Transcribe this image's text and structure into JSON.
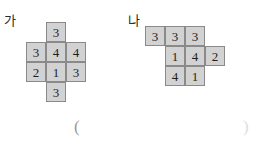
{
  "figures": [
    {
      "label": "가",
      "label_x": 4,
      "label_y": 14,
      "grid_x": 26,
      "grid_y": 22,
      "cells": [
        {
          "col": 1,
          "row": 0,
          "value": "3"
        },
        {
          "col": 0,
          "row": 1,
          "value": "3"
        },
        {
          "col": 1,
          "row": 1,
          "value": "4"
        },
        {
          "col": 2,
          "row": 1,
          "value": "4"
        },
        {
          "col": 0,
          "row": 2,
          "value": "2"
        },
        {
          "col": 1,
          "row": 2,
          "value": "1"
        },
        {
          "col": 2,
          "row": 2,
          "value": "3"
        },
        {
          "col": 1,
          "row": 3,
          "value": "3"
        }
      ]
    },
    {
      "label": "나",
      "label_x": 128,
      "label_y": 14,
      "grid_x": 145,
      "grid_y": 26,
      "cells": [
        {
          "col": 0,
          "row": 0,
          "value": "3"
        },
        {
          "col": 1,
          "row": 0,
          "value": "3"
        },
        {
          "col": 2,
          "row": 0,
          "value": "3"
        },
        {
          "col": 1,
          "row": 1,
          "value": "1"
        },
        {
          "col": 2,
          "row": 1,
          "value": "4"
        },
        {
          "col": 3,
          "row": 1,
          "value": "2"
        },
        {
          "col": 1,
          "row": 2,
          "value": "4"
        },
        {
          "col": 2,
          "row": 2,
          "value": "1"
        }
      ]
    }
  ],
  "answer_blank": {
    "open_paren": "(",
    "close_paren": ")",
    "open_x": 74,
    "open_y": 118,
    "close_x": 243,
    "close_y": 118
  },
  "colors": {
    "cell_fill": "#d2d2d2",
    "cell_border": "#8a8a8a",
    "text": "#1f1f1f",
    "label": "#2b2b2b",
    "page_bg": "#ffffff"
  }
}
